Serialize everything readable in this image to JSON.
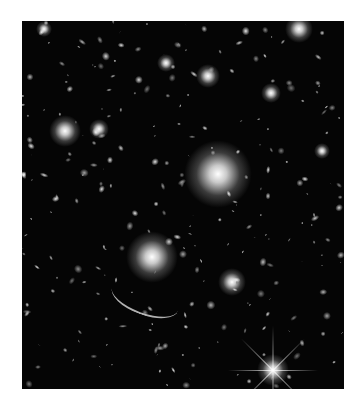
{
  "image": {
    "subject": "galaxy cluster deep field (astronomical photograph)",
    "background_color": "#050505",
    "frame": {
      "left": 22,
      "top": 21,
      "width": 322,
      "height": 368
    },
    "bright_objects": [
      {
        "x": 196,
        "y": 153,
        "r": 34,
        "label": "central-cluster-galaxy"
      },
      {
        "x": 130,
        "y": 236,
        "r": 26,
        "label": "bright-galaxy-lower-left"
      },
      {
        "x": 251,
        "y": 349,
        "r": 16,
        "label": "foreground-star"
      },
      {
        "x": 43,
        "y": 110,
        "r": 16,
        "label": "galaxy-left"
      },
      {
        "x": 210,
        "y": 261,
        "r": 14,
        "label": "galaxy-lower-right"
      },
      {
        "x": 186,
        "y": 55,
        "r": 12,
        "label": "galaxy-top"
      },
      {
        "x": 22,
        "y": 8,
        "r": 8,
        "label": "star-top-left"
      },
      {
        "x": 144,
        "y": 42,
        "r": 9,
        "label": "galaxy-top-center"
      },
      {
        "x": 77,
        "y": 108,
        "r": 10,
        "label": "galaxy-left-2"
      },
      {
        "x": 249,
        "y": 72,
        "r": 10,
        "label": "galaxy-top-right"
      },
      {
        "x": 300,
        "y": 130,
        "r": 8,
        "label": "galaxy-right"
      },
      {
        "x": 277,
        "y": 8,
        "r": 14,
        "label": "diffuse-top-right"
      }
    ]
  }
}
